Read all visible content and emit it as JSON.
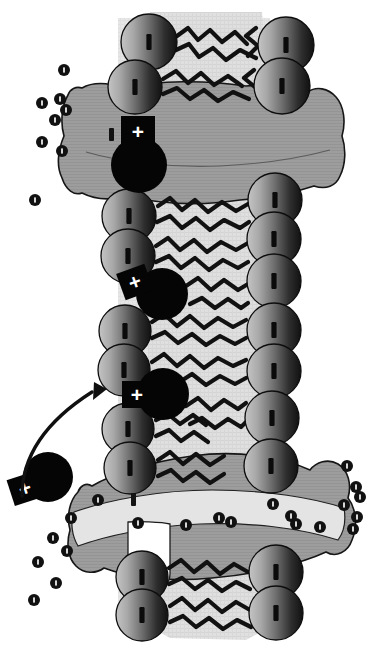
{
  "figure": {
    "orientation": "vertical",
    "background_color": "#ffffff"
  },
  "palette": {
    "background": "#ffffff",
    "membrane_interior": "#d9d9d9",
    "membrane_interior_light": "#e3e3e3",
    "protein_fill": "#9a9a9a",
    "protein_channel_fill": "#d2d2d2",
    "protein_outline": "#1a1a1a",
    "lipid_head_light": "#b8b8b8",
    "lipid_head_dark": "#141414",
    "lipid_head_outline": "#0d0d0d",
    "lipid_tail": "#111111",
    "charged_molecule": "#050505",
    "charge_badge": "#050505",
    "charge_symbol": "#ffffff",
    "ion_fill": "#111111",
    "ion_mark": "#ffffff",
    "arrow": "#101010"
  },
  "legend_symbols": {
    "lipid_head": "lipid-head-circle",
    "lipid_tail": "lipid-tail-zigzag",
    "charged_molecule": "+",
    "ion": "ion-dot",
    "protein": "membrane-protein-blob",
    "transport_arrow": "curved-arrow"
  },
  "counts": {
    "lipid_heads_left": 13,
    "lipid_heads_right": 13,
    "charged_molecules": 4,
    "membrane_proteins": 2,
    "ions_total": 29,
    "arrows": 1
  },
  "membrane": {
    "band_x": 118,
    "band_width": 146,
    "band_top": 14,
    "band_bottom": 640,
    "interior_label": "hydrophobic-core"
  },
  "lipid_heads_left": [
    {
      "cx": 149,
      "cy": 42,
      "r": 28
    },
    {
      "cx": 135,
      "cy": 87,
      "r": 27
    },
    {
      "cx": 129,
      "cy": 216,
      "r": 27
    },
    {
      "cx": 128,
      "cy": 256,
      "r": 27
    },
    {
      "cx": 125,
      "cy": 331,
      "r": 26
    },
    {
      "cx": 124,
      "cy": 370,
      "r": 26
    },
    {
      "cx": 128,
      "cy": 429,
      "r": 26
    },
    {
      "cx": 130,
      "cy": 468,
      "r": 26
    },
    {
      "cx": 142,
      "cy": 577,
      "r": 26
    },
    {
      "cx": 142,
      "cy": 615,
      "r": 26
    }
  ],
  "lipid_heads_right": [
    {
      "cx": 286,
      "cy": 45,
      "r": 28
    },
    {
      "cx": 282,
      "cy": 86,
      "r": 28
    },
    {
      "cx": 275,
      "cy": 200,
      "r": 27
    },
    {
      "cx": 274,
      "cy": 239,
      "r": 27
    },
    {
      "cx": 274,
      "cy": 281,
      "r": 27
    },
    {
      "cx": 274,
      "cy": 330,
      "r": 27
    },
    {
      "cx": 274,
      "cy": 371,
      "r": 27
    },
    {
      "cx": 272,
      "cy": 418,
      "r": 27
    },
    {
      "cx": 271,
      "cy": 466,
      "r": 27
    },
    {
      "cx": 276,
      "cy": 572,
      "r": 27
    },
    {
      "cx": 276,
      "cy": 613,
      "r": 27
    }
  ],
  "charged_molecules": [
    {
      "id": "charge-1",
      "cx": 139,
      "cy": 165,
      "r": 28,
      "badge_x": 121,
      "badge_y": 116,
      "badge_w": 34,
      "badge_h": 32,
      "rotation": 0,
      "symbol": "+"
    },
    {
      "id": "charge-2",
      "cx": 162,
      "cy": 294,
      "r": 26,
      "badge_x": 120,
      "badge_y": 268,
      "badge_w": 30,
      "badge_h": 28,
      "rotation": -20,
      "symbol": "+"
    },
    {
      "id": "charge-3",
      "cx": 163,
      "cy": 394,
      "r": 26,
      "badge_x": 122,
      "badge_y": 381,
      "badge_w": 30,
      "badge_h": 27,
      "rotation": 0,
      "symbol": "+"
    },
    {
      "id": "charge-4",
      "cx": 48,
      "cy": 477,
      "r": 25,
      "badge_x": 10,
      "badge_y": 475,
      "badge_w": 30,
      "badge_h": 27,
      "rotation": -18,
      "symbol": "+"
    }
  ],
  "proteins": [
    {
      "id": "protein-upper",
      "name": "upper-membrane-protein",
      "label": "transmembrane protein"
    },
    {
      "id": "protein-lower",
      "name": "lower-channel-protein",
      "label": "channel protein"
    }
  ],
  "ions": [
    {
      "cx": 64,
      "cy": 70,
      "r": 6
    },
    {
      "cx": 42,
      "cy": 103,
      "r": 6
    },
    {
      "cx": 60,
      "cy": 99,
      "r": 6
    },
    {
      "cx": 66,
      "cy": 110,
      "r": 6
    },
    {
      "cx": 55,
      "cy": 120,
      "r": 6
    },
    {
      "cx": 42,
      "cy": 142,
      "r": 6
    },
    {
      "cx": 62,
      "cy": 151,
      "r": 6
    },
    {
      "cx": 35,
      "cy": 200,
      "r": 6
    },
    {
      "cx": 347,
      "cy": 466,
      "r": 6
    },
    {
      "cx": 356,
      "cy": 487,
      "r": 6
    },
    {
      "cx": 360,
      "cy": 497,
      "r": 6
    },
    {
      "cx": 344,
      "cy": 505,
      "r": 6
    },
    {
      "cx": 357,
      "cy": 517,
      "r": 6
    },
    {
      "cx": 353,
      "cy": 529,
      "r": 6
    },
    {
      "cx": 98,
      "cy": 500,
      "r": 6
    },
    {
      "cx": 138,
      "cy": 523,
      "r": 6
    },
    {
      "cx": 186,
      "cy": 525,
      "r": 6
    },
    {
      "cx": 219,
      "cy": 518,
      "r": 6
    },
    {
      "cx": 231,
      "cy": 522,
      "r": 6
    },
    {
      "cx": 291,
      "cy": 516,
      "r": 6
    },
    {
      "cx": 296,
      "cy": 524,
      "r": 6
    },
    {
      "cx": 320,
      "cy": 527,
      "r": 6
    },
    {
      "cx": 71,
      "cy": 518,
      "r": 6
    },
    {
      "cx": 53,
      "cy": 538,
      "r": 6
    },
    {
      "cx": 67,
      "cy": 551,
      "r": 6
    },
    {
      "cx": 38,
      "cy": 562,
      "r": 6
    },
    {
      "cx": 56,
      "cy": 583,
      "r": 6
    },
    {
      "cx": 34,
      "cy": 600,
      "r": 6
    },
    {
      "cx": 273,
      "cy": 504,
      "r": 6
    }
  ],
  "arrow": {
    "name": "transport-arrow",
    "path": "M 22 496 C 22 455, 48 420, 92 392",
    "head_points": "94,382 107,389 93,400",
    "description": "curved arrow from free charged molecule toward membrane"
  }
}
